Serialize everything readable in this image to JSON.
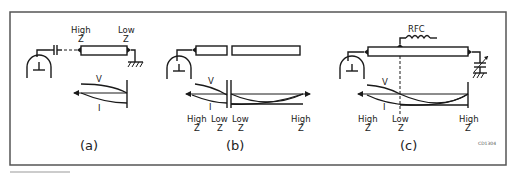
{
  "figure": {
    "code": "CD1304",
    "panels": [
      {
        "id": "a",
        "caption": "(a)",
        "labels": {
          "left_top": "High",
          "left_bottom": "Z",
          "right_top": "Low",
          "right_bottom": "Z",
          "voltage": "V",
          "current": "I"
        }
      },
      {
        "id": "b",
        "caption": "(b)",
        "labels": {
          "z1_top": "High",
          "z1_bottom": "Z",
          "z2_top": "Low",
          "z2_bottom": "Z",
          "z3_top": "Low",
          "z3_bottom": "Z",
          "z4_top": "High",
          "z4_bottom": "Z",
          "voltage": "V",
          "current": "I"
        }
      },
      {
        "id": "c",
        "caption": "(c)",
        "labels": {
          "rfc": "RFC",
          "z1_top": "High",
          "z1_bottom": "Z",
          "z2_top": "Low",
          "z2_bottom": "Z",
          "z3_top": "High",
          "z3_bottom": "Z",
          "voltage": "V",
          "current": "I"
        }
      }
    ]
  }
}
